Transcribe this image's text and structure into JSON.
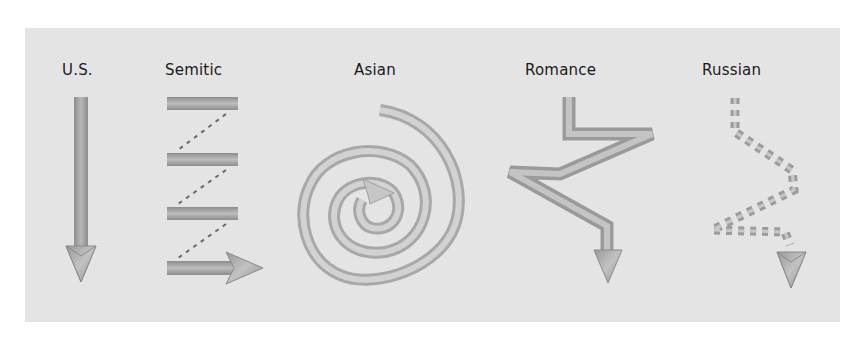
{
  "diagram": {
    "background_color": "#e4e4e4",
    "stroke_color": "#a0a0a0",
    "columns": [
      {
        "id": "us",
        "label": "U.S.",
        "pattern": "straight-down-arrow"
      },
      {
        "id": "semitic",
        "label": "Semitic",
        "pattern": "parallel-bars-zigzag-dotted-arrow-right"
      },
      {
        "id": "asian",
        "label": "Asian",
        "pattern": "inward-spiral-arrow"
      },
      {
        "id": "romance",
        "label": "Romance",
        "pattern": "zigzag-digression-arrow-down"
      },
      {
        "id": "russian",
        "label": "Russian",
        "pattern": "dashed-zigzag-digression-arrow-down"
      }
    ]
  }
}
